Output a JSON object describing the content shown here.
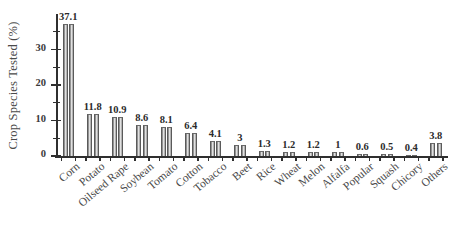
{
  "chart_data": {
    "type": "bar",
    "title": "",
    "xlabel": "",
    "ylabel": "Crop Species Tested (%)",
    "ylim": [
      0,
      40
    ],
    "yticks": [
      0,
      10,
      20,
      30
    ],
    "ytick_labels": [
      "0",
      "10",
      "20",
      "30"
    ],
    "yminor_ticks": [
      5,
      15,
      25,
      35
    ],
    "grid": false,
    "legend": null,
    "categories": [
      "Corn",
      "Potato",
      "Oilseed Rape",
      "Soybean",
      "Tomato",
      "Cotton",
      "Tobacco",
      "Beet",
      "Rice",
      "Wheat",
      "Melon",
      "Alfalfa",
      "Popular",
      "Squash",
      "Chicory",
      "Others"
    ],
    "values": [
      37.1,
      11.8,
      10.9,
      8.6,
      8.1,
      6.4,
      4.1,
      3,
      1.3,
      1.2,
      1.2,
      1,
      0.6,
      0.5,
      0.4,
      3.8
    ],
    "value_labels": [
      "37.1",
      "11.8",
      "10.9",
      "8.6",
      "8.1",
      "6.4",
      "4.1",
      "3",
      "1.3",
      "1.2",
      "1.2",
      "1",
      "0.6",
      "0.5",
      "0.4",
      "3.8"
    ],
    "bar_color_light": "#f2f2f2",
    "bar_color_dark": "#6e6e6e",
    "axis_color": "#2f2f2f"
  }
}
